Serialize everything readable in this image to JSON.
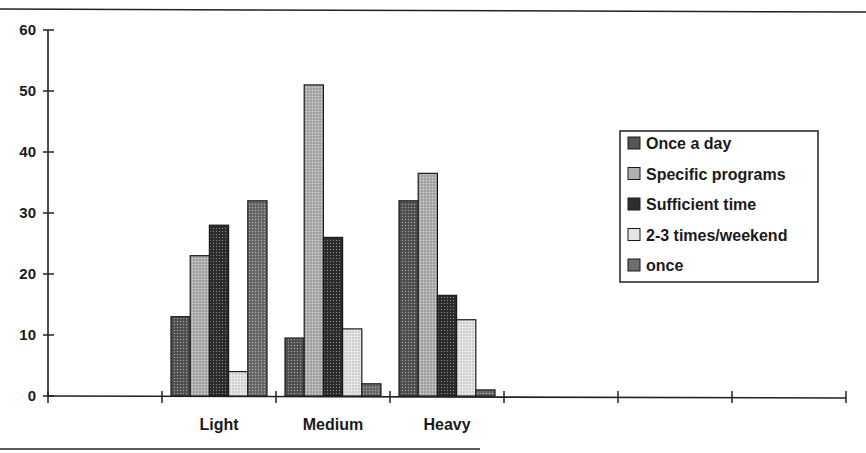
{
  "chart_data": {
    "type": "bar",
    "title": "",
    "xlabel": "",
    "ylabel": "",
    "ylim": [
      0,
      60
    ],
    "yticks": [
      0,
      10,
      20,
      30,
      40,
      50,
      60
    ],
    "grid": false,
    "legend_position": "right",
    "categories": [
      "",
      "Light",
      "Medium",
      "Heavy",
      "",
      "",
      ""
    ],
    "series": [
      {
        "name": "Once a day",
        "values": [
          null,
          13,
          9.5,
          32,
          null,
          null,
          null
        ],
        "fill": "#555555"
      },
      {
        "name": "Specific programs",
        "values": [
          null,
          23,
          51,
          36.5,
          null,
          null,
          null
        ],
        "fill": "#b0b0b0"
      },
      {
        "name": "Sufficient time",
        "values": [
          null,
          28,
          26,
          16.5,
          null,
          null,
          null
        ],
        "fill": "#2e2e2e"
      },
      {
        "name": "2-3 times/weekend",
        "values": [
          null,
          4,
          11,
          12.5,
          null,
          null,
          null
        ],
        "fill": "#e4e4e4"
      },
      {
        "name": "once",
        "values": [
          null,
          32,
          2,
          1,
          null,
          null,
          null
        ],
        "fill": "#6e6e6e"
      }
    ]
  }
}
